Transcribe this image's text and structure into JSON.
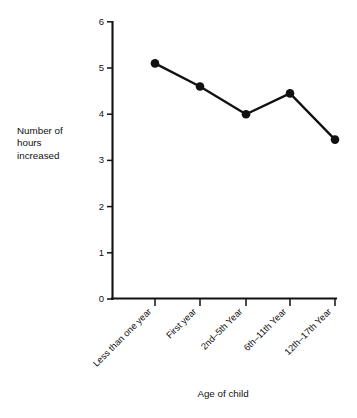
{
  "chart_data": {
    "type": "line",
    "title": "",
    "subtitle": "",
    "xlabel": "Age of child",
    "ylabel": "Number of\nhours\nincreased",
    "ylabel_lines": [
      "Number of",
      "hours",
      "increased"
    ],
    "categories": [
      "Less than one year",
      "First year",
      "2nd–5th Year",
      "6th–11th Year",
      "12th–17th Year"
    ],
    "values": [
      5.1,
      4.6,
      4.0,
      4.45,
      3.45
    ],
    "series": [
      {
        "name": "Number of hours increased",
        "values": [
          5.1,
          4.6,
          4.0,
          4.45,
          3.45
        ]
      }
    ],
    "ylim": [
      0,
      6
    ],
    "yticks": [
      0,
      1,
      2,
      3,
      4,
      5,
      6
    ],
    "ytick_labels": [
      "0",
      "1",
      "2",
      "3",
      "4",
      "5",
      "6"
    ],
    "xtick_rotation_deg": -45,
    "grid": false,
    "legend": false,
    "legend_position": "none",
    "marker": "filled-circle",
    "line_color": "#111111",
    "marker_color": "#111111",
    "background_color": "#ffffff"
  },
  "geometry": {
    "plot_left": 112,
    "plot_right": 336,
    "y_zero_px": 299,
    "y_top_px": 22,
    "px_per_unit": 46.2,
    "x_positions": [
      155,
      200,
      246,
      290,
      335
    ]
  }
}
